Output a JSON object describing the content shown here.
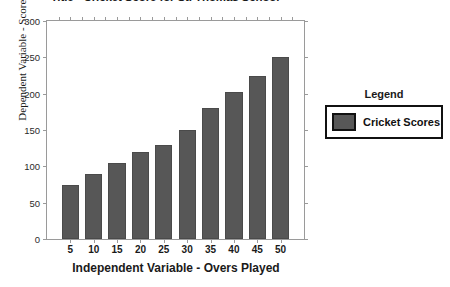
{
  "chart_data": {
    "type": "bar",
    "title": "Title - Cricket Score for St. Thomas School",
    "xlabel": "Independent Variable - Overs Played",
    "ylabel": "Dependent Variable - Scores",
    "categories": [
      "5",
      "10",
      "15",
      "20",
      "25",
      "30",
      "35",
      "40",
      "45",
      "50"
    ],
    "values": [
      75,
      90,
      105,
      120,
      130,
      150,
      180,
      203,
      225,
      250
    ],
    "series": [
      {
        "name": "Cricket Scores",
        "values": [
          75,
          90,
          105,
          120,
          130,
          150,
          180,
          203,
          225,
          250
        ],
        "color": "#575757"
      }
    ],
    "ylim": [
      0,
      300
    ],
    "yticks": [
      "0",
      "50",
      "100",
      "150",
      "200",
      "250",
      "300"
    ],
    "ytick_values": [
      0,
      50,
      100,
      150,
      200,
      250,
      300
    ],
    "grid": false,
    "legend_position": "right"
  },
  "legend": {
    "title": "Legend",
    "entries": [
      {
        "label": "Cricket Scores",
        "color": "#575757"
      }
    ]
  }
}
